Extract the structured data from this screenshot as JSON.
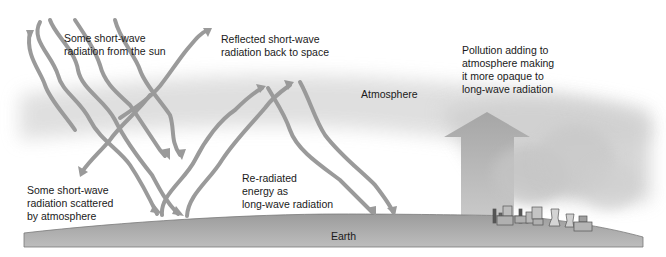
{
  "diagram": {
    "labels": {
      "sun_radiation": "Some short-wave\nradiation from the sun",
      "reflected": "Reflected short-wave\nradiation back to space",
      "pollution": "Pollution adding to\natmosphere making\nit more opaque to\nlong-wave radiation",
      "atmosphere": "Atmosphere",
      "scattered": "Some short-wave\nradiation scattered\nby atmosphere",
      "reradiated": "Re-radiated\nenergy as\nlong-wave radiation",
      "earth": "Earth"
    },
    "colors": {
      "arrow": "#9a9a9a",
      "atmosphere_band": "#d9d9d9",
      "earth": "#a8a8a8",
      "earth_edge": "#6e6e6e",
      "pollution_arrow": "#b5b5b5",
      "smoke": "#c4c4c4",
      "text": "#1a1a1a"
    },
    "elements": {
      "incoming_arrows": 4,
      "reflected_arrows": 1,
      "scattered_arrows": 1,
      "reradiated_up_arrows": 2,
      "returning_down_arrows": 2,
      "factory_icon": "factory-with-cooling-towers",
      "pollution_arrow_icon": "up-arrow"
    }
  }
}
